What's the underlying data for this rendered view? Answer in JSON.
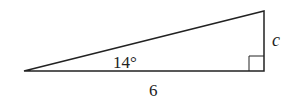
{
  "diagram": {
    "type": "right-triangle",
    "colors": {
      "stroke": "#222222",
      "background": "#ffffff"
    },
    "vertices": {
      "left": [
        24,
        71
      ],
      "right_bottom": [
        264,
        71
      ],
      "right_top": [
        264,
        11
      ]
    },
    "right_angle_marker": {
      "corner": "right_bottom",
      "size": 15
    },
    "labels": {
      "angle": "14°",
      "base": "6",
      "opposite_side": "c"
    }
  }
}
